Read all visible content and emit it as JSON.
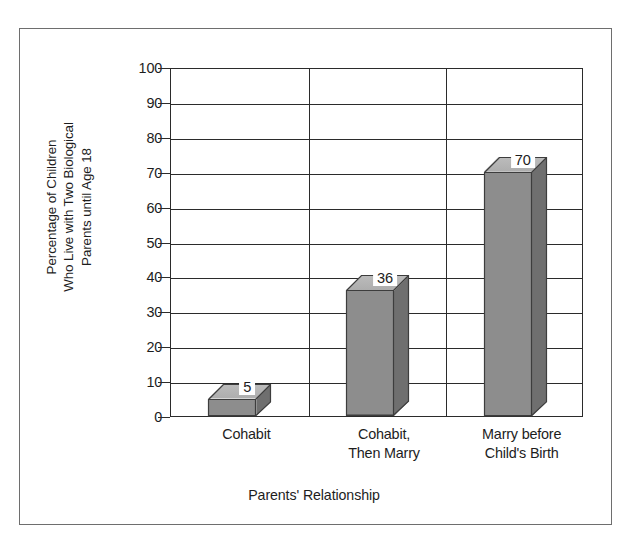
{
  "chart_data": {
    "type": "bar",
    "title": "",
    "xlabel": "Parents' Relationship",
    "ylabel": "Percentage of Children Who Live with Two Biological Parents until Age 18",
    "ylabel_lines": [
      "Percentage of Children",
      "Who Live with Two Biological",
      "Parents until Age 18"
    ],
    "categories": [
      "Cohabit",
      "Cohabit, Then Marry",
      "Marry before Child's Birth"
    ],
    "category_label_lines": [
      [
        "Cohabit"
      ],
      [
        "Cohabit,",
        "Then Marry"
      ],
      [
        "Marry before",
        "Child's Birth"
      ]
    ],
    "values": [
      5,
      36,
      70
    ],
    "value_labels": [
      "5",
      "36",
      "70"
    ],
    "ylim": [
      0,
      100
    ],
    "ytick_values": [
      0,
      10,
      20,
      30,
      40,
      50,
      60,
      70,
      80,
      90,
      100
    ],
    "ytick_labels": [
      "0",
      "10",
      "20",
      "30",
      "40",
      "50",
      "60",
      "70",
      "80",
      "90",
      "100"
    ],
    "grid": true,
    "legend": "none",
    "style": "3d-column",
    "colors": {
      "bar_front": "#8d8d8d",
      "bar_top": "#b6b6b6",
      "bar_side": "#6f6f6f",
      "bar_edge": "#3d3d3d",
      "axis": "#2b2b2b",
      "frame": "#6e6e6e",
      "background": "#ffffff",
      "text": "#1d1d1d"
    }
  }
}
